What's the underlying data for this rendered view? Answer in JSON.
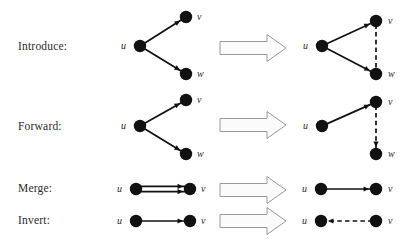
{
  "figure": {
    "background": "#ffffff",
    "node_color": "#111111",
    "edge_color": "#111111",
    "arrow_fill": "#fbfbfb",
    "arrow_stroke": "#9a9a9a",
    "width": 412,
    "height": 246
  },
  "rows": [
    {
      "id": "introduce",
      "label": "Introduce:",
      "label_x": 18,
      "label_y": 50,
      "arrow": {
        "x": 220,
        "y": 48,
        "length": 66,
        "shaft_half": 6.5,
        "head_half": 13.5,
        "head_len": 19
      },
      "before": {
        "nodes": [
          {
            "name": "u",
            "x": 140,
            "y": 46,
            "r": 6.2,
            "label_x": 126,
            "label_y": 49,
            "label_anchor": "end"
          },
          {
            "name": "v",
            "x": 186,
            "y": 17,
            "r": 6.2,
            "label_x": 197,
            "label_y": 20,
            "label_anchor": "start"
          },
          {
            "name": "w",
            "x": 186,
            "y": 74,
            "r": 6.2,
            "label_x": 197,
            "label_y": 77,
            "label_anchor": "start"
          }
        ],
        "edges": [
          {
            "from": "u",
            "to": "v",
            "style": "solid",
            "arrowhead": true
          },
          {
            "from": "u",
            "to": "w",
            "style": "solid",
            "arrowhead": true
          }
        ]
      },
      "after": {
        "nodes": [
          {
            "name": "u",
            "x": 322,
            "y": 46,
            "r": 6.2,
            "label_x": 308,
            "label_y": 49,
            "label_anchor": "end"
          },
          {
            "name": "v",
            "x": 376,
            "y": 21,
            "r": 6.2,
            "label_x": 388,
            "label_y": 24,
            "label_anchor": "start"
          },
          {
            "name": "w",
            "x": 376,
            "y": 74,
            "r": 6.2,
            "label_x": 388,
            "label_y": 77,
            "label_anchor": "start"
          }
        ],
        "edges": [
          {
            "from": "u",
            "to": "v",
            "style": "solid",
            "arrowhead": true
          },
          {
            "from": "u",
            "to": "w",
            "style": "solid",
            "arrowhead": true
          },
          {
            "from": "v",
            "to": "w",
            "style": "dashed",
            "arrowhead": false
          }
        ]
      }
    },
    {
      "id": "forward",
      "label": "Forward:",
      "label_x": 18,
      "label_y": 130,
      "arrow": {
        "x": 220,
        "y": 125,
        "length": 66,
        "shaft_half": 6.5,
        "head_half": 13.5,
        "head_len": 19
      },
      "before": {
        "nodes": [
          {
            "name": "u",
            "x": 140,
            "y": 126,
            "r": 6.2,
            "label_x": 126,
            "label_y": 129,
            "label_anchor": "end"
          },
          {
            "name": "v",
            "x": 186,
            "y": 100,
            "r": 6.2,
            "label_x": 197,
            "label_y": 103,
            "label_anchor": "start"
          },
          {
            "name": "w",
            "x": 186,
            "y": 154,
            "r": 6.2,
            "label_x": 197,
            "label_y": 157,
            "label_anchor": "start"
          }
        ],
        "edges": [
          {
            "from": "u",
            "to": "v",
            "style": "solid",
            "arrowhead": true
          },
          {
            "from": "u",
            "to": "w",
            "style": "solid",
            "arrowhead": true
          }
        ]
      },
      "after": {
        "nodes": [
          {
            "name": "u",
            "x": 322,
            "y": 126,
            "r": 6.2,
            "label_x": 308,
            "label_y": 129,
            "label_anchor": "end"
          },
          {
            "name": "v",
            "x": 376,
            "y": 102,
            "r": 6.2,
            "label_x": 388,
            "label_y": 105,
            "label_anchor": "start"
          },
          {
            "name": "w",
            "x": 376,
            "y": 154,
            "r": 6.2,
            "label_x": 388,
            "label_y": 157,
            "label_anchor": "start"
          }
        ],
        "edges": [
          {
            "from": "u",
            "to": "v",
            "style": "solid",
            "arrowhead": true
          },
          {
            "from": "v",
            "to": "w",
            "style": "dashed",
            "arrowhead": true
          }
        ]
      }
    },
    {
      "id": "merge",
      "label": "Merge:",
      "label_x": 18,
      "label_y": 192,
      "arrow": {
        "x": 220,
        "y": 190,
        "length": 66,
        "shaft_half": 6.5,
        "head_half": 13.5,
        "head_len": 19
      },
      "before": {
        "nodes": [
          {
            "name": "u",
            "x": 136,
            "y": 189,
            "r": 6.2,
            "label_x": 122,
            "label_y": 192,
            "label_anchor": "end"
          },
          {
            "name": "v",
            "x": 190,
            "y": 189,
            "r": 6.2,
            "label_x": 201,
            "label_y": 192,
            "label_anchor": "start"
          }
        ],
        "edges": [
          {
            "from": "u",
            "to": "v",
            "style": "solid",
            "arrowhead": true,
            "offset": -2.6
          },
          {
            "from": "u",
            "to": "v",
            "style": "solid",
            "arrowhead": true,
            "offset": 2.6
          }
        ]
      },
      "after": {
        "nodes": [
          {
            "name": "u",
            "x": 321,
            "y": 189,
            "r": 6.2,
            "label_x": 307,
            "label_y": 192,
            "label_anchor": "end"
          },
          {
            "name": "v",
            "x": 376,
            "y": 189,
            "r": 6.2,
            "label_x": 388,
            "label_y": 192,
            "label_anchor": "start"
          }
        ],
        "edges": [
          {
            "from": "u",
            "to": "v",
            "style": "solid",
            "arrowhead": true
          }
        ]
      }
    },
    {
      "id": "invert",
      "label": "Invert:",
      "label_x": 18,
      "label_y": 224,
      "arrow": {
        "x": 220,
        "y": 221,
        "length": 66,
        "shaft_half": 6.5,
        "head_half": 13.5,
        "head_len": 19
      },
      "before": {
        "nodes": [
          {
            "name": "u",
            "x": 136,
            "y": 221,
            "r": 6.2,
            "label_x": 122,
            "label_y": 224,
            "label_anchor": "end"
          },
          {
            "name": "v",
            "x": 190,
            "y": 221,
            "r": 6.2,
            "label_x": 201,
            "label_y": 224,
            "label_anchor": "start"
          }
        ],
        "edges": [
          {
            "from": "u",
            "to": "v",
            "style": "solid",
            "arrowhead": true
          }
        ]
      },
      "after": {
        "nodes": [
          {
            "name": "u",
            "x": 321,
            "y": 221,
            "r": 6.2,
            "label_x": 307,
            "label_y": 224,
            "label_anchor": "end"
          },
          {
            "name": "v",
            "x": 376,
            "y": 221,
            "r": 6.2,
            "label_x": 388,
            "label_y": 224,
            "label_anchor": "start"
          }
        ],
        "edges": [
          {
            "from": "v",
            "to": "u",
            "style": "dashed",
            "arrowhead": true
          }
        ]
      }
    }
  ]
}
